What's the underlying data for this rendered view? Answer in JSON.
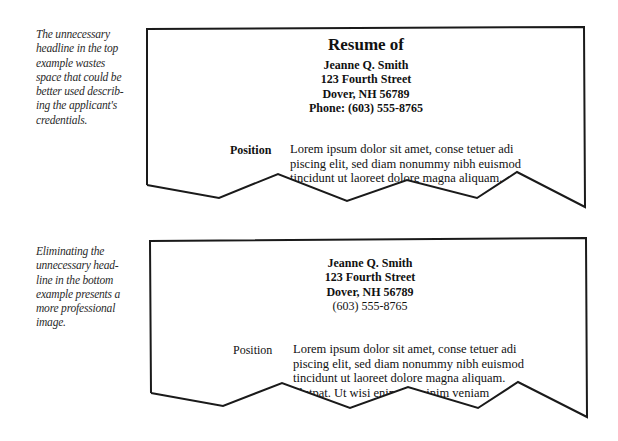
{
  "captions": {
    "top": {
      "lines": [
        "The unnecessary",
        "headline in the top",
        "example wastes",
        "space that could be",
        "better used describ-",
        "ing the applicant's",
        "credentials."
      ]
    },
    "bottom": {
      "lines": [
        "Eliminating the",
        "unnecessary head-",
        "line in the bottom",
        "example presents a",
        "more professional",
        "image."
      ]
    }
  },
  "examples": {
    "top": {
      "title": "Resume of",
      "contact": [
        "Jeanne Q. Smith",
        "123 Fourth Street",
        "Dover, NH 56789",
        "Phone: (603) 555-8765"
      ],
      "section_label": "Position",
      "body_lines": [
        "Lorem ipsum dolor sit amet, conse tetuer adi",
        "piscing elit, sed diam nonummy nibh euismod",
        "tincidunt ut laoreet dolore magna aliquam."
      ]
    },
    "bottom": {
      "contact": [
        "Jeanne Q. Smith",
        "123 Fourth Street",
        "Dover, NH 56789",
        "(603) 555-8765"
      ],
      "section_label": "Position",
      "body_lines": [
        "Lorem ipsum dolor sit amet, conse tetuer adi",
        "piscing elit, sed diam nonummy nibh euismod",
        "tincidunt ut laoreet dolore magna aliquam.",
        "olutpat.  Ut wisi enim ad minim veniam"
      ]
    }
  },
  "colors": {
    "stroke": "#1a1a1a",
    "text": "#111111",
    "caption": "#2a2a2a"
  }
}
